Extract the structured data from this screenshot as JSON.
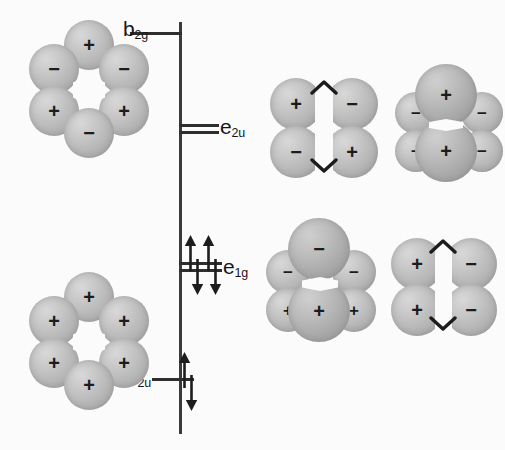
{
  "figure": {
    "type": "molecular-orbital-energy-diagram",
    "background_color": "#fbfbfb",
    "ink_color": "#2e2e2e",
    "lobe_color": "#b4b4b4"
  },
  "axis": {
    "name": "energy-axis",
    "x": 179,
    "top": 22,
    "bottom": 434
  },
  "levels": [
    {
      "id": "b2g",
      "label_text": "b",
      "label_sub": "2g",
      "label_x": 123,
      "label_y": 18,
      "side": "left",
      "degeneracy": 1,
      "electrons": 0,
      "lines": [
        {
          "x": 130,
          "y": 32,
          "w": 52
        }
      ],
      "energy_rank": 4
    },
    {
      "id": "e2u",
      "label_text": "e",
      "label_sub": "2u",
      "label_x": 219,
      "label_y": 117,
      "side": "right",
      "degeneracy": 2,
      "electrons": 0,
      "lines": [
        {
          "x": 179,
          "y": 124,
          "w": 40
        },
        {
          "x": 179,
          "y": 131,
          "w": 40
        }
      ],
      "energy_rank": 3
    },
    {
      "id": "e1g",
      "label_text": "e",
      "label_sub": "1g",
      "label_x": 222,
      "label_y": 258,
      "side": "right",
      "degeneracy": 2,
      "electrons": 4,
      "lines": [
        {
          "x": 179,
          "y": 262,
          "w": 43
        },
        {
          "x": 179,
          "y": 269,
          "w": 43
        }
      ],
      "energy_rank": 2
    },
    {
      "id": "a2u",
      "label_text": "a",
      "label_sub": "2u",
      "label_x": 128,
      "label_y": 367,
      "side": "left",
      "degeneracy": 1,
      "electrons": 2,
      "lines": [
        {
          "x": 152,
          "y": 379,
          "w": 40
        }
      ],
      "energy_rank": 1
    }
  ],
  "electron_arrows": [
    {
      "level": "a2u",
      "x": 182,
      "y": 360,
      "direction": "up"
    },
    {
      "level": "a2u",
      "x": 182,
      "y": 380,
      "direction": "down"
    },
    {
      "level": "e1g",
      "x": 190,
      "y": 240,
      "direction": "up"
    },
    {
      "level": "e1g",
      "x": 190,
      "y": 266,
      "direction": "down"
    },
    {
      "level": "e1g",
      "x": 206,
      "y": 240,
      "direction": "up"
    },
    {
      "level": "e1g",
      "x": 206,
      "y": 266,
      "direction": "down"
    }
  ],
  "orbitals": [
    {
      "id": "b2g-orbital",
      "name": "b2g-ring-orbital",
      "shape": "hexagonal-ring",
      "x": 22,
      "y": 20,
      "w": 132,
      "h": 140,
      "signs": [
        "+",
        "−",
        "−",
        "+",
        "+",
        "−"
      ],
      "description": "six-lobe ring, alternating signs"
    },
    {
      "id": "a2u-orbital",
      "name": "a2u-ring-orbital",
      "shape": "hexagonal-ring",
      "x": 22,
      "y": 272,
      "w": 132,
      "h": 140,
      "signs": [
        "+",
        "+",
        "+",
        "+",
        "+",
        "+"
      ],
      "description": "six-lobe ring, all same sign"
    },
    {
      "id": "e2u-orbital-a",
      "name": "e2u-orbital-quadrant",
      "shape": "four-lobe-quadrant",
      "x": 272,
      "y": 80,
      "w": 104,
      "h": 98,
      "signs": {
        "top_left": "+",
        "top_right": "−",
        "bottom_left": "−",
        "bottom_right": "+"
      },
      "nodes": 2
    },
    {
      "id": "e2u-orbital-b",
      "name": "e2u-orbital-vertical-pair",
      "shape": "two-big-four-small",
      "x": 395,
      "y": 66,
      "w": 108,
      "h": 114,
      "signs": {
        "top_big": "+",
        "bottom_big": "+",
        "side_small": "−"
      },
      "nodes": 2
    },
    {
      "id": "e1g-orbital-a",
      "name": "e1g-orbital-vertical-pair",
      "shape": "two-big-four-small",
      "x": 265,
      "y": 225,
      "w": 110,
      "h": 118,
      "signs": {
        "top_big": "−",
        "bottom_big": "+",
        "top_small": "−",
        "bottom_small": "+"
      },
      "nodes": 1
    },
    {
      "id": "e1g-orbital-b",
      "name": "e1g-orbital-column-pair",
      "shape": "four-lobe-columns",
      "x": 393,
      "y": 240,
      "w": 102,
      "h": 96,
      "signs": {
        "left_top": "+",
        "left_bottom": "+",
        "right_top": "−",
        "right_bottom": "−"
      },
      "nodes": 1
    }
  ]
}
